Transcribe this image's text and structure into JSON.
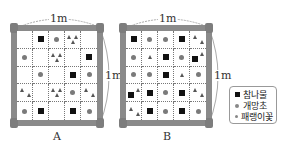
{
  "diagram": {
    "dimension_label": "1m",
    "quadrats": [
      {
        "label": "A",
        "grid": [
          [
            "",
            "sq",
            "ci",
            "tri3",
            ""
          ],
          [
            "ci",
            "",
            "tri3",
            "",
            "sq"
          ],
          [
            "",
            "ci",
            "",
            "sq",
            "ci"
          ],
          [
            "tri2",
            "",
            "tri3",
            "ci",
            "tri2"
          ],
          [
            "ci",
            "sq",
            "",
            "sq",
            "ci"
          ]
        ]
      },
      {
        "label": "B",
        "grid": [
          [
            "sq",
            "ci",
            "ci",
            "sq",
            "tri2"
          ],
          [
            "ci",
            "tri1",
            "sq",
            "ci",
            "sq-tri"
          ],
          [
            "ci",
            "ci",
            "sq",
            "tri1",
            "ci"
          ],
          [
            "sq-tri",
            "sq",
            "ci",
            "sq",
            "tri2"
          ],
          [
            "tri2",
            "sq",
            "ci",
            "sq",
            "ci"
          ]
        ]
      }
    ],
    "legend": [
      {
        "symbol": "square",
        "label": "참나물"
      },
      {
        "symbol": "circle",
        "label": "개망초"
      },
      {
        "symbol": "triangle",
        "label": "패랭이꽃"
      }
    ]
  }
}
